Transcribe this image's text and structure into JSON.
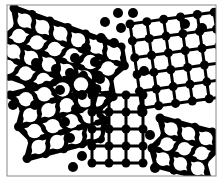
{
  "figure": {
    "frame": {
      "x": 7,
      "y": 5,
      "width": 209,
      "height": 171,
      "stroke": "#888888"
    },
    "colors": {
      "background": "#ffffff",
      "atom": "#000000",
      "bond": "#000000",
      "void": "#ffffff"
    },
    "grains": [
      {
        "name": "top-left-hex-grain",
        "lattice": "hexagonal",
        "origin": [
          14,
          8
        ],
        "spacing": 19,
        "angle": 20,
        "rows": 5,
        "cols": 7
      },
      {
        "name": "top-right-square-grain",
        "lattice": "square",
        "origin": [
          130,
          24
        ],
        "spacing": 17,
        "angle": -8,
        "rows": 6,
        "cols": 6
      },
      {
        "name": "left-hex-grain",
        "lattice": "hexagonal",
        "origin": [
          10,
          95
        ],
        "spacing": 19,
        "angle": -15,
        "rows": 5,
        "cols": 5
      },
      {
        "name": "center-square-grain",
        "lattice": "square",
        "origin": [
          92,
          95
        ],
        "spacing": 17,
        "angle": 0,
        "rows": 5,
        "cols": 4
      },
      {
        "name": "bottom-right-hex-grain",
        "lattice": "hexagonal",
        "origin": [
          160,
          118
        ],
        "spacing": 18,
        "angle": 15,
        "rows": 4,
        "cols": 4
      }
    ],
    "boundary_atoms": [
      [
        118,
        13
      ],
      [
        133,
        13
      ],
      [
        105,
        22
      ],
      [
        121,
        28
      ],
      [
        101,
        38
      ],
      [
        114,
        43
      ],
      [
        86,
        48
      ],
      [
        75,
        58
      ],
      [
        95,
        62
      ],
      [
        36,
        63
      ],
      [
        56,
        69
      ],
      [
        70,
        73
      ],
      [
        100,
        79
      ],
      [
        60,
        90
      ],
      [
        82,
        95
      ],
      [
        35,
        105
      ],
      [
        142,
        112
      ],
      [
        76,
        109
      ],
      [
        65,
        122
      ],
      [
        70,
        138
      ],
      [
        150,
        135
      ],
      [
        82,
        156
      ],
      [
        73,
        167
      ],
      [
        155,
        168
      ],
      [
        185,
        24
      ],
      [
        202,
        28
      ],
      [
        13,
        105
      ],
      [
        144,
        71
      ]
    ]
  }
}
